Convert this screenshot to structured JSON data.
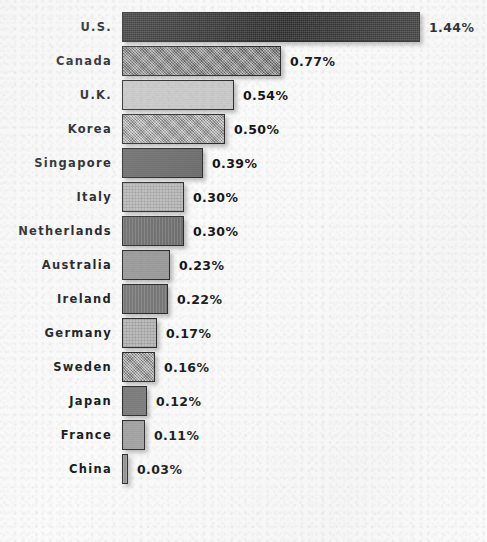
{
  "chart_data": {
    "type": "bar",
    "orientation": "horizontal",
    "title": "",
    "subtitle": "",
    "xlabel": "",
    "ylabel": "",
    "grid": false,
    "legend": false,
    "axis_visible": false,
    "xlim": [
      0,
      1.44
    ],
    "value_suffix": "%",
    "categories": [
      "U.S.",
      "Canada",
      "U.K.",
      "Korea",
      "Singapore",
      "Italy",
      "Netherlands",
      "Australia",
      "Ireland",
      "Germany",
      "Sweden",
      "Japan",
      "France",
      "China"
    ],
    "values": [
      1.44,
      0.77,
      0.54,
      0.5,
      0.39,
      0.3,
      0.3,
      0.23,
      0.22,
      0.17,
      0.16,
      0.12,
      0.11,
      0.03
    ],
    "value_labels": [
      "1.44%",
      "0.77%",
      "0.54%",
      "0.50%",
      "0.39%",
      "0.30%",
      "0.30%",
      "0.23%",
      "0.22%",
      "0.17%",
      "0.16%",
      "0.12%",
      "0.11%",
      "0.03%"
    ],
    "bar_colors": [
      "#3a3a3a",
      "#8a8a8a",
      "#c9c9c9",
      "#b2b2b2",
      "#6c6c6c",
      "#b8b8b8",
      "#767676",
      "#9a9a9a",
      "#7e7e7e",
      "#b5b5b5",
      "#a9a9a9",
      "#7a7a7a",
      "#a2a2a2",
      "#9c9c9c"
    ],
    "bar_textures": [
      "tex-dot",
      "tex-noise",
      "tex-plain",
      "tex-noise",
      "tex-plain",
      "tex-grid",
      "tex-vert",
      "tex-plain",
      "tex-vert",
      "tex-grid",
      "tex-noise",
      "tex-plain",
      "tex-plain",
      "tex-vert"
    ],
    "background_color": "#fbfbfb",
    "label_color": "#16181a",
    "value_color": "#101214"
  }
}
